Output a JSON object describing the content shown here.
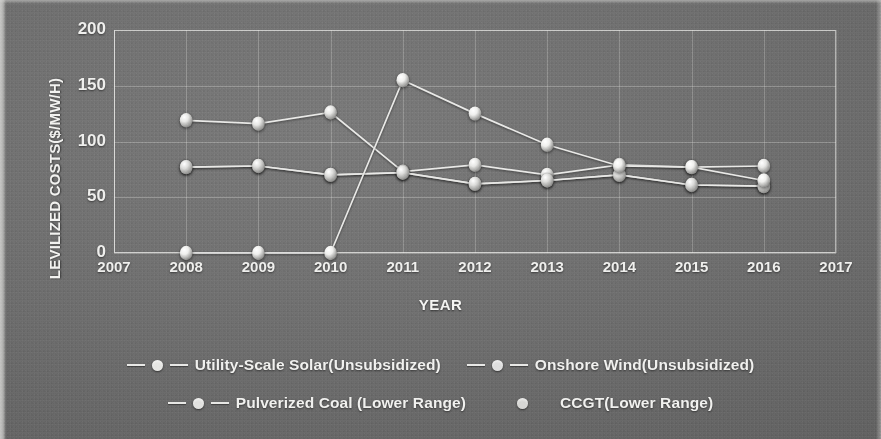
{
  "chart_data": {
    "type": "line",
    "title": "",
    "xlabel": "YEAR",
    "ylabel": "LEVILIZED COSTS($/MW/H)",
    "x": [
      2007,
      2008,
      2009,
      2010,
      2011,
      2012,
      2013,
      2014,
      2015,
      2016,
      2017
    ],
    "xtick_labels": [
      "2007",
      "2008",
      "2009",
      "2010",
      "2011",
      "2012",
      "2013",
      "2014",
      "2015",
      "2016",
      "2017"
    ],
    "ytick_labels": [
      "0",
      "50",
      "100",
      "150",
      "200"
    ],
    "yticks": [
      0,
      50,
      100,
      150,
      200
    ],
    "xlim": [
      2007,
      2017
    ],
    "ylim": [
      0,
      200
    ],
    "grid": true,
    "legend_position": "bottom",
    "marker": "circle",
    "series": [
      {
        "name": "Utility-Scale Solar(Unsubsidized)",
        "color": "#e6e6e4",
        "x": [
          2008,
          2009,
          2010,
          2011,
          2012,
          2013,
          2014,
          2015,
          2016
        ],
        "values": [
          119,
          116,
          126,
          73,
          79,
          70,
          79,
          77,
          78
        ]
      },
      {
        "name": "Onshore Wind(Unsubsidized)",
        "color": "#cfcfcd",
        "x": [
          2008,
          2009,
          2010,
          2011,
          2012,
          2013,
          2014,
          2015,
          2016
        ],
        "values": [
          77,
          78,
          70,
          72,
          62,
          65,
          70,
          61,
          60
        ]
      },
      {
        "name": "Pulverized Coal (Lower Range)",
        "color": "#dcdcda",
        "x": [
          2008,
          2009,
          2010,
          2011,
          2012,
          2013,
          2014,
          2015,
          2016
        ],
        "values": [
          77,
          78,
          70,
          72,
          62,
          65,
          70,
          61,
          60
        ]
      },
      {
        "name": "CCGT(Lower Range)",
        "color": "#efefed",
        "x": [
          2008,
          2009,
          2010,
          2011,
          2012,
          2013,
          2014,
          2015,
          2016
        ],
        "values": [
          0,
          0,
          0,
          155,
          125,
          97,
          78,
          77,
          65
        ]
      }
    ]
  },
  "legend": {
    "rows": [
      [
        {
          "label": "Utility-Scale Solar(Unsubsidized)",
          "marker": "dash-dot-dash",
          "color": "#e6e6e4"
        },
        {
          "label": "Onshore Wind(Unsubsidized)",
          "marker": "dash-dot-dash",
          "color": "#dedede"
        }
      ],
      [
        {
          "label": "Pulverized Coal (Lower Range)",
          "marker": "dash-dot-dash",
          "color": "#e2e2e0"
        },
        {
          "label": "CCGT(Lower Range)",
          "marker": "dot-only",
          "color": "#d6d6d4"
        }
      ]
    ]
  }
}
